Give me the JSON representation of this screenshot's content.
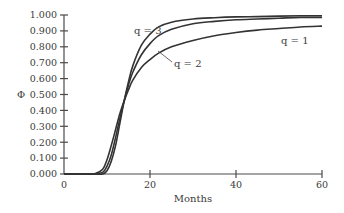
{
  "chart_data": {
    "type": "line",
    "title": "",
    "xlabel": "Months",
    "ylabel": "Φ",
    "xlim": [
      0,
      60
    ],
    "ylim": [
      0,
      1.0
    ],
    "x_ticks": [
      "0",
      "20",
      "40",
      "60"
    ],
    "y_ticks": [
      "0.000",
      "0.100",
      "0.200",
      "0.300",
      "0.400",
      "0.500",
      "0.600",
      "0.700",
      "0.800",
      "0.900",
      "1.000"
    ],
    "grid": false,
    "legend": "none (inline annotations)",
    "x": [
      0,
      5,
      7,
      9,
      10,
      11,
      12,
      13,
      14,
      15,
      16,
      18,
      20,
      22,
      25,
      30,
      35,
      40,
      45,
      50,
      55,
      60
    ],
    "series": [
      {
        "name": "q = 1",
        "values": [
          0,
          0,
          0.0,
          0.03,
          0.09,
          0.18,
          0.28,
          0.38,
          0.46,
          0.53,
          0.59,
          0.67,
          0.72,
          0.76,
          0.8,
          0.84,
          0.87,
          0.89,
          0.905,
          0.915,
          0.925,
          0.93
        ]
      },
      {
        "name": "q = 2",
        "values": [
          0,
          0,
          0.0,
          0.01,
          0.05,
          0.12,
          0.23,
          0.35,
          0.46,
          0.56,
          0.64,
          0.75,
          0.82,
          0.87,
          0.91,
          0.945,
          0.96,
          0.97,
          0.975,
          0.98,
          0.985,
          0.985
        ]
      },
      {
        "name": "q = 3",
        "values": [
          0,
          0,
          0.0,
          0.0,
          0.02,
          0.08,
          0.18,
          0.32,
          0.46,
          0.58,
          0.68,
          0.81,
          0.88,
          0.925,
          0.955,
          0.975,
          0.983,
          0.988,
          0.99,
          0.993,
          0.995,
          0.995
        ]
      }
    ],
    "annotations": [
      {
        "text": "q = 3",
        "x": 17,
        "y": 0.91
      },
      {
        "text": "q = 2",
        "x": 29,
        "y": 0.72
      },
      {
        "text": "q = 1",
        "x": 51,
        "y": 0.83
      }
    ]
  },
  "labels": {
    "xlabel": "Months",
    "ylabel": "Φ",
    "q1": "q = 1",
    "q2": "q = 2",
    "q3": "q = 3"
  }
}
